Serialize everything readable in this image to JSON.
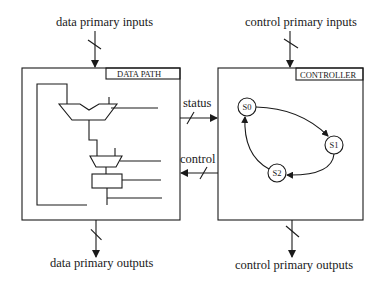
{
  "diagram": {
    "type": "controller-datapath block diagram",
    "datapath": {
      "title": "DATA PATH",
      "input_label": "data primary inputs",
      "output_label": "data primary outputs",
      "components": [
        "upper ALU/adder",
        "multiplexer",
        "register"
      ]
    },
    "controller": {
      "title": "CONTROLLER",
      "input_label": "control primary inputs",
      "output_label": "control primary outputs",
      "states": [
        "S0",
        "S1",
        "S2"
      ],
      "transitions": [
        {
          "from": "S0",
          "to": "S1"
        },
        {
          "from": "S1",
          "to": "S2"
        },
        {
          "from": "S2",
          "to": "S0"
        }
      ]
    },
    "links": {
      "status_label": "status",
      "control_label": "control"
    },
    "colors": {
      "line": "#1a1a1a",
      "background": "#ffffff"
    }
  }
}
